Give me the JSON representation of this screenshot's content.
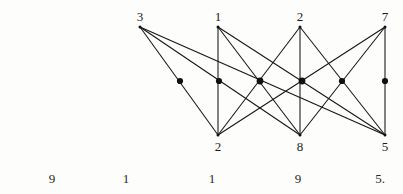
{
  "figure": {
    "background_color": "#fdfdfc",
    "line_color": "#141414",
    "dot_color": "#111111"
  },
  "top_vertices": [
    {
      "label": "3",
      "x": 140,
      "y": 27,
      "label_x": 140,
      "label_y": 10
    },
    {
      "label": "1",
      "x": 218,
      "y": 27,
      "label_x": 218,
      "label_y": 10
    },
    {
      "label": "2",
      "x": 300,
      "y": 27,
      "label_x": 300,
      "label_y": 10
    },
    {
      "label": "7",
      "x": 385,
      "y": 27,
      "label_x": 385,
      "label_y": 10
    }
  ],
  "bottom_vertices": [
    {
      "label": "2",
      "x": 218,
      "y": 135,
      "label_x": 218,
      "label_y": 140
    },
    {
      "label": "8",
      "x": 300,
      "y": 135,
      "label_x": 300,
      "label_y": 140
    },
    {
      "label": "5",
      "x": 385,
      "y": 135,
      "label_x": 385,
      "label_y": 140
    }
  ],
  "edges": [
    {
      "from": "T3",
      "to": "B2",
      "x1": 140,
      "y1": 27,
      "x2": 218,
      "y2": 135
    },
    {
      "from": "T3",
      "to": "B8",
      "x1": 140,
      "y1": 27,
      "x2": 300,
      "y2": 135
    },
    {
      "from": "T3",
      "to": "B5",
      "x1": 140,
      "y1": 27,
      "x2": 385,
      "y2": 135
    },
    {
      "from": "T1",
      "to": "B2",
      "x1": 218,
      "y1": 27,
      "x2": 218,
      "y2": 135
    },
    {
      "from": "T1",
      "to": "B8",
      "x1": 218,
      "y1": 27,
      "x2": 300,
      "y2": 135
    },
    {
      "from": "T1",
      "to": "B5",
      "x1": 218,
      "y1": 27,
      "x2": 385,
      "y2": 135
    },
    {
      "from": "T2",
      "to": "B2",
      "x1": 300,
      "y1": 27,
      "x2": 218,
      "y2": 135
    },
    {
      "from": "T2",
      "to": "B8",
      "x1": 300,
      "y1": 27,
      "x2": 300,
      "y2": 135
    },
    {
      "from": "T2",
      "to": "B5",
      "x1": 300,
      "y1": 27,
      "x2": 385,
      "y2": 135
    },
    {
      "from": "T7",
      "to": "B2",
      "x1": 385,
      "y1": 27,
      "x2": 218,
      "y2": 135
    },
    {
      "from": "T7",
      "to": "B8",
      "x1": 385,
      "y1": 27,
      "x2": 300,
      "y2": 135
    },
    {
      "from": "T7",
      "to": "B5",
      "x1": 385,
      "y1": 27,
      "x2": 385,
      "y2": 135
    }
  ],
  "midpoint_dots": [
    {
      "x": 180,
      "y": 81,
      "r": 3.1
    },
    {
      "x": 219,
      "y": 81,
      "r": 3.1
    },
    {
      "x": 260,
      "y": 81,
      "r": 3.4
    },
    {
      "x": 302,
      "y": 81,
      "r": 3.4
    },
    {
      "x": 342,
      "y": 81,
      "r": 3.1
    },
    {
      "x": 385,
      "y": 81,
      "r": 3.1
    }
  ],
  "bottom_row_numbers": [
    {
      "text": "9",
      "x": 52,
      "y": 172
    },
    {
      "text": "1",
      "x": 126,
      "y": 172
    },
    {
      "text": "1",
      "x": 212,
      "y": 172
    },
    {
      "text": "9",
      "x": 298,
      "y": 172
    },
    {
      "text": "5.",
      "x": 380,
      "y": 172
    }
  ]
}
